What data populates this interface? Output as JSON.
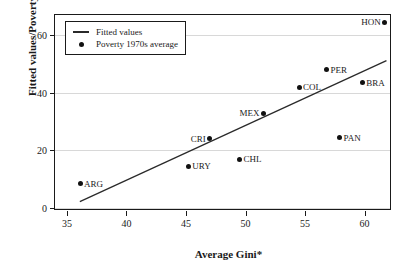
{
  "chart_data": {
    "type": "scatter",
    "title": "",
    "xlabel": "Average Gini*",
    "ylabel": "Fitted values/Poverty",
    "xlim": [
      34.0,
      62.3
    ],
    "ylim": [
      -1.0,
      67.0
    ],
    "xticks": [
      35,
      40,
      45,
      50,
      55,
      60
    ],
    "yticks": [
      0,
      20,
      40,
      60
    ],
    "grid": true,
    "legend_position": "top-left",
    "series": [
      {
        "name": "Fitted values",
        "type": "line",
        "color": "#2a2a2a",
        "x": [
          36.1,
          62.0
        ],
        "y": [
          1.6,
          51.0
        ]
      },
      {
        "name": "Poverty 1970s average",
        "type": "scatter",
        "color": "#111111",
        "points": [
          {
            "label": "ARG",
            "x": 36.1,
            "y": 8.5,
            "label_side": "right"
          },
          {
            "label": "URY",
            "x": 45.2,
            "y": 14.5,
            "label_side": "right"
          },
          {
            "label": "CRI",
            "x": 47.0,
            "y": 24.0,
            "label_side": "left"
          },
          {
            "label": "CHL",
            "x": 49.5,
            "y": 17.0,
            "label_side": "right"
          },
          {
            "label": "MEX",
            "x": 51.5,
            "y": 33.0,
            "label_side": "left"
          },
          {
            "label": "COL",
            "x": 54.5,
            "y": 42.0,
            "label_side": "right"
          },
          {
            "label": "PER",
            "x": 56.8,
            "y": 48.0,
            "label_side": "right"
          },
          {
            "label": "PAN",
            "x": 57.9,
            "y": 24.5,
            "label_side": "right"
          },
          {
            "label": "BRA",
            "x": 59.8,
            "y": 43.5,
            "label_side": "right"
          },
          {
            "label": "HON",
            "x": 61.7,
            "y": 64.5,
            "label_side": "left"
          }
        ]
      }
    ]
  },
  "legend": {
    "entries": [
      {
        "key": "line",
        "label": "Fitted values"
      },
      {
        "key": "dot",
        "label": "Poverty 1970s average"
      }
    ]
  }
}
